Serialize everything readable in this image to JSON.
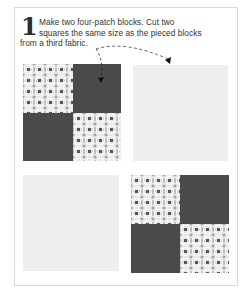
{
  "step": {
    "number": "1",
    "line1": "Make two four-patch blocks. Cut two",
    "line2": "squares the same size as the pieced blocks",
    "line3": "from a third fabric."
  },
  "blocks": [
    {
      "name": "four-patch-block-1",
      "quadrants": [
        "patterned",
        "dark",
        "dark",
        "patterned"
      ]
    },
    {
      "name": "plain-square-1",
      "fabric": "light"
    },
    {
      "name": "plain-square-2",
      "fabric": "light"
    },
    {
      "name": "four-patch-block-2",
      "quadrants": [
        "patterned",
        "dark",
        "dark",
        "patterned"
      ]
    }
  ],
  "colors": {
    "dark_fabric": "#4a4a4a",
    "light_fabric": "#efefef",
    "pattern_base": "#e9e9e9",
    "border": "#d8d8d8",
    "text": "#333333"
  },
  "icons": {
    "arrows": "dashed-arrow-icon"
  }
}
